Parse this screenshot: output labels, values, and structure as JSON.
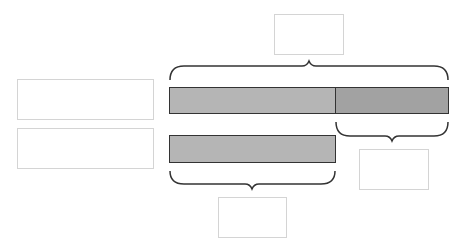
{
  "diagram": {
    "type": "tape-diagram",
    "colors": {
      "segment_light": "#b5b5b5",
      "segment_dark": "#a2a2a2",
      "bar_border": "#333333",
      "brace": "#333333",
      "box_border": "#d4d4d4"
    },
    "label_boxes": {
      "row_1_label": "",
      "row_2_label": ""
    },
    "answer_boxes": {
      "total": "",
      "difference": "",
      "smaller_part": ""
    },
    "bars": [
      {
        "name": "row-1",
        "segments": [
          {
            "name": "equal-part",
            "shade": "light"
          },
          {
            "name": "extra-part",
            "shade": "dark"
          }
        ]
      },
      {
        "name": "row-2",
        "segments": [
          {
            "name": "equal-part",
            "shade": "light"
          }
        ]
      }
    ],
    "braces": [
      {
        "name": "total-brace",
        "spans": "row-1 full length",
        "position": "above"
      },
      {
        "name": "difference-brace",
        "spans": "row-1 extra part",
        "position": "below"
      },
      {
        "name": "smaller-part-brace",
        "spans": "row-2 full length",
        "position": "below"
      }
    ]
  }
}
